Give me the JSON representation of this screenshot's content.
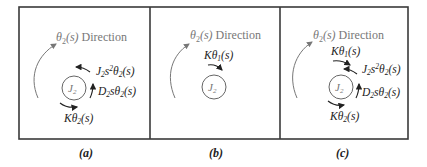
{
  "figure": {
    "panels": [
      {
        "id": "a",
        "caption": "(a)",
        "direction_label": "θ2(s) Direction",
        "inertia_label": "J2",
        "forces": [
          "J2s²θ2(s)",
          "D2sθ2(s)",
          "Kθ2(s)"
        ]
      },
      {
        "id": "b",
        "caption": "(b)",
        "direction_label": "θ2(s) Direction",
        "inertia_label": "J2",
        "forces": [
          "Kθ1(s)"
        ]
      },
      {
        "id": "c",
        "caption": "(c)",
        "direction_label": "θ2(s) Direction",
        "inertia_label": "J2",
        "forces": [
          "Kθ1(s)",
          "J2s²θ2(s)",
          "D2sθ2(s)",
          "Kθ2(s)"
        ]
      }
    ]
  },
  "text": {
    "theta": "θ",
    "sub2": "2",
    "sub1": "1",
    "s_paren": "(s)",
    "direction": " Direction",
    "J": "J",
    "K": "K",
    "D": "D",
    "s": "s",
    "sup2": "2",
    "cap_a": "(a)",
    "cap_b": "(b)",
    "cap_c": "(c)"
  }
}
